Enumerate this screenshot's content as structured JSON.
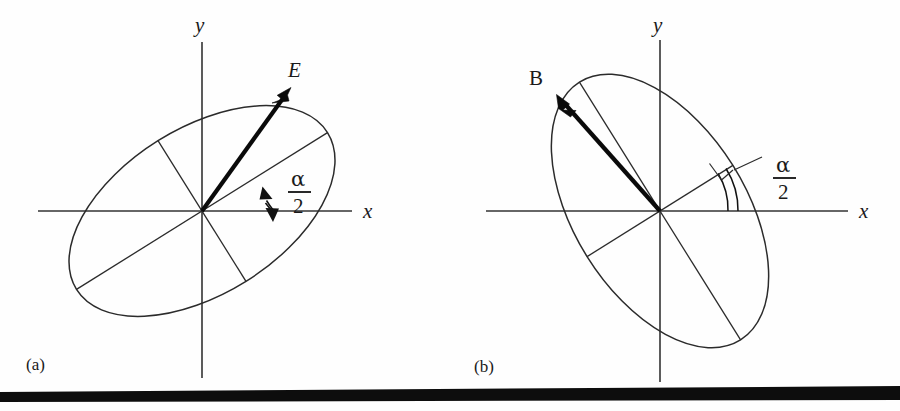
{
  "figure": {
    "panels": [
      {
        "id": "a",
        "panel_label": "(a)",
        "vector_label": "E",
        "vector_style": "italic",
        "axis_x_label": "x",
        "axis_y_label": "y",
        "angle_numerator": "α",
        "angle_denominator": "2",
        "angle_annotation": "α/2",
        "description": "Polarization ellipse for the electric field E, major axis tilted counter-clockwise from the x axis by alpha/2",
        "origin": {
          "x": 202,
          "y": 211
        },
        "ellipse": {
          "semi_major": 148,
          "semi_minor": 83,
          "rotation_deg": -32
        },
        "vector_tip": {
          "x": 289,
          "y": 90
        },
        "angle_arc": {
          "radius": 72,
          "start_deg": 0,
          "end_deg": 32,
          "double_headed": true
        }
      },
      {
        "id": "b",
        "panel_label": "(b)",
        "vector_label": "B",
        "vector_style": "roman",
        "axis_x_label": "x",
        "axis_y_label": "y",
        "angle_numerator": "α",
        "angle_denominator": "2",
        "angle_annotation": "α/2",
        "description": "Polarization ellipse for the magnetic field B, orthogonal to panel (a), major axis tilted from the x axis by alpha/2 with a right-angle tick",
        "origin": {
          "x": 210,
          "y": 211
        },
        "ellipse": {
          "semi_major": 152,
          "semi_minor": 86,
          "rotation_deg": -122
        },
        "vector_tip": {
          "x": 108,
          "y": 96
        },
        "angle_arc": {
          "radius": 78,
          "start_deg": 0,
          "end_deg": 32,
          "double_headed": false,
          "right_angle_tick": true
        }
      }
    ],
    "colors": {
      "ink": "#2b2b2b",
      "vector": "#0a0a0a",
      "background": "#fefefe",
      "rule": "#0d0d0d"
    },
    "bottom_rule": {
      "present": true,
      "note": "thick black scan band across the bottom of the page"
    }
  }
}
